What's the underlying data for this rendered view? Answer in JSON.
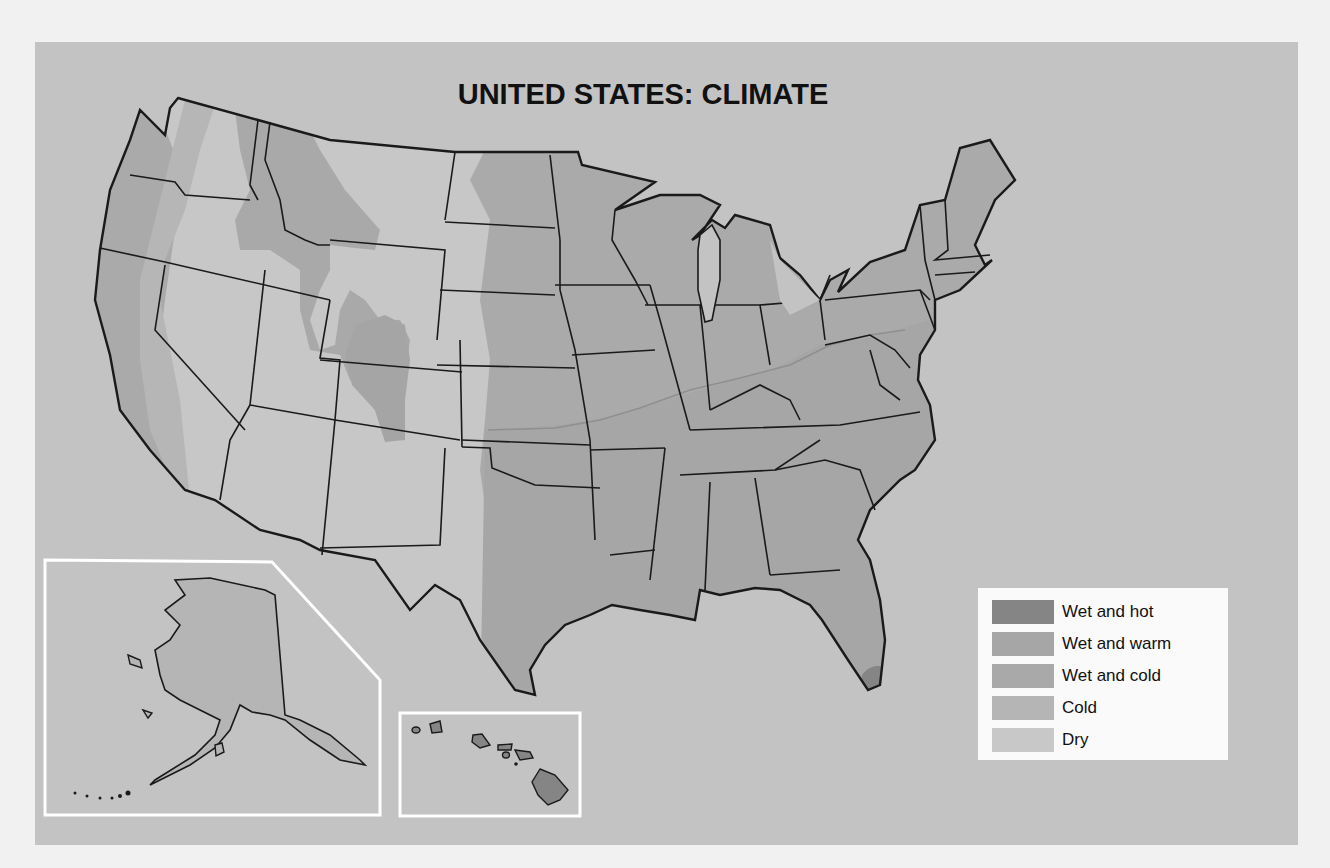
{
  "map": {
    "title": "UNITED STATES: CLIMATE",
    "type": "choropleth-climate-map",
    "region": "United States",
    "insets": [
      {
        "name": "Alaska",
        "climate": "Cold"
      },
      {
        "name": "Hawaii",
        "climate": "Wet and hot"
      }
    ],
    "colors": {
      "page_bg": "#f1f1f1",
      "panel_bg": "#c3c3c3",
      "border": "#1a1a1a",
      "inset_frame": "#ffffff"
    }
  },
  "legend": {
    "items": [
      {
        "label": "Wet and hot",
        "color": "#858585"
      },
      {
        "label": "Wet and warm",
        "color": "#a6a6a6"
      },
      {
        "label": "Wet and cold",
        "color": "#a9a9a9"
      },
      {
        "label": "Cold",
        "color": "#b5b5b5"
      },
      {
        "label": "Dry",
        "color": "#c8c8c8"
      }
    ]
  }
}
